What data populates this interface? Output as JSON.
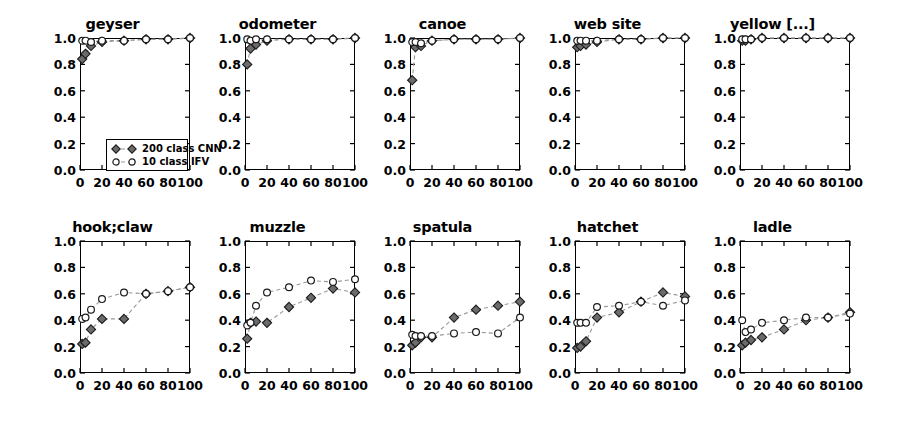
{
  "figure": {
    "background_color": "#ffffff",
    "rows": 2,
    "cols": 5,
    "marker_color": "#6b6b6b",
    "marker_edge_color": "#1a1a1a",
    "line_color": "#999999"
  },
  "legend": {
    "position": "lower-left of first panel",
    "entries": [
      {
        "label": "200 class CNN",
        "marker": "filled-diamond",
        "color": "#6b6b6b"
      },
      {
        "label": "10 class IFV",
        "marker": "open-circle",
        "color": "#ffffff"
      }
    ]
  },
  "axes": {
    "xlim": [
      0,
      100
    ],
    "ylim": [
      0.0,
      1.0
    ],
    "xticks": [
      0,
      20,
      40,
      60,
      80,
      100
    ],
    "xtick_labels": [
      "0",
      "20",
      "40",
      "60",
      "80",
      "100"
    ],
    "yticks": [
      0.0,
      0.2,
      0.4,
      0.6,
      0.8,
      1.0
    ],
    "ytick_labels": [
      "0.0",
      "0.2",
      "0.4",
      "0.6",
      "0.8",
      "1.0"
    ],
    "grid": false
  },
  "chart_data": {
    "type": "line",
    "title": "",
    "xlabel": "",
    "ylabel": "",
    "xlim": [
      0,
      100
    ],
    "ylim": [
      0.0,
      1.0
    ],
    "grid": false,
    "legend_position": "lower-left",
    "x": [
      2,
      5,
      10,
      20,
      40,
      60,
      80,
      100
    ],
    "panels": [
      {
        "title": "geyser",
        "row": 0,
        "col": 0,
        "series": [
          {
            "name": "200 class CNN",
            "marker": "filled-diamond",
            "x": [
              2,
              5,
              10,
              20,
              40,
              60,
              80,
              100
            ],
            "values": [
              0.84,
              0.88,
              0.94,
              0.97,
              0.98,
              0.99,
              0.99,
              1.0
            ]
          },
          {
            "name": "10 class IFV",
            "marker": "open-circle",
            "x": [
              2,
              5,
              10,
              20,
              40,
              60,
              80,
              100
            ],
            "values": [
              0.98,
              0.98,
              0.97,
              0.98,
              0.98,
              0.99,
              0.99,
              1.0
            ]
          }
        ]
      },
      {
        "title": "odometer",
        "row": 0,
        "col": 1,
        "series": [
          {
            "name": "200 class CNN",
            "marker": "filled-diamond",
            "x": [
              2,
              5,
              10,
              20,
              40,
              60,
              80,
              100
            ],
            "values": [
              0.8,
              0.92,
              0.95,
              0.98,
              0.99,
              0.99,
              0.99,
              1.0
            ]
          },
          {
            "name": "10 class IFV",
            "marker": "open-circle",
            "x": [
              2,
              5,
              10,
              20,
              40,
              60,
              80,
              100
            ],
            "values": [
              0.99,
              0.98,
              0.99,
              0.99,
              0.99,
              0.99,
              0.99,
              1.0
            ]
          }
        ]
      },
      {
        "title": "canoe",
        "row": 0,
        "col": 2,
        "series": [
          {
            "name": "200 class CNN",
            "marker": "filled-diamond",
            "x": [
              2,
              5,
              10,
              20,
              40,
              60,
              80,
              100
            ],
            "values": [
              0.68,
              0.93,
              0.94,
              0.98,
              0.99,
              0.99,
              0.99,
              1.0
            ]
          },
          {
            "name": "10 class IFV",
            "marker": "open-circle",
            "x": [
              2,
              5,
              10,
              20,
              40,
              60,
              80,
              100
            ],
            "values": [
              0.97,
              0.97,
              0.96,
              0.98,
              0.99,
              0.99,
              0.99,
              1.0
            ]
          }
        ]
      },
      {
        "title": "web site",
        "row": 0,
        "col": 3,
        "series": [
          {
            "name": "200 class CNN",
            "marker": "filled-diamond",
            "x": [
              2,
              5,
              10,
              20,
              40,
              60,
              80,
              100
            ],
            "values": [
              0.93,
              0.94,
              0.95,
              0.97,
              0.99,
              0.99,
              1.0,
              1.0
            ]
          },
          {
            "name": "10 class IFV",
            "marker": "open-circle",
            "x": [
              2,
              5,
              10,
              20,
              40,
              60,
              80,
              100
            ],
            "values": [
              0.98,
              0.98,
              0.98,
              0.98,
              0.99,
              0.99,
              1.0,
              1.0
            ]
          }
        ]
      },
      {
        "title": "yellow [...]",
        "row": 0,
        "col": 4,
        "series": [
          {
            "name": "200 class CNN",
            "marker": "filled-diamond",
            "x": [
              2,
              5,
              10,
              20,
              40,
              60,
              80,
              100
            ],
            "values": [
              0.98,
              0.98,
              0.99,
              1.0,
              1.0,
              1.0,
              1.0,
              1.0
            ]
          },
          {
            "name": "10 class IFV",
            "marker": "open-circle",
            "x": [
              2,
              5,
              10,
              20,
              40,
              60,
              80,
              100
            ],
            "values": [
              0.99,
              0.99,
              0.99,
              1.0,
              1.0,
              1.0,
              1.0,
              1.0
            ]
          }
        ]
      },
      {
        "title": "hook;claw",
        "row": 1,
        "col": 0,
        "series": [
          {
            "name": "200 class CNN",
            "marker": "filled-diamond",
            "x": [
              2,
              5,
              10,
              20,
              40,
              60,
              80,
              100
            ],
            "values": [
              0.22,
              0.23,
              0.33,
              0.41,
              0.41,
              0.6,
              0.62,
              0.65
            ]
          },
          {
            "name": "10 class IFV",
            "marker": "open-circle",
            "x": [
              2,
              5,
              10,
              20,
              40,
              60,
              80,
              100
            ],
            "values": [
              0.41,
              0.42,
              0.48,
              0.56,
              0.61,
              0.6,
              0.62,
              0.65
            ]
          }
        ]
      },
      {
        "title": "muzzle",
        "row": 1,
        "col": 1,
        "series": [
          {
            "name": "200 class CNN",
            "marker": "filled-diamond",
            "x": [
              2,
              5,
              10,
              20,
              40,
              60,
              80,
              100
            ],
            "values": [
              0.26,
              0.38,
              0.39,
              0.38,
              0.5,
              0.57,
              0.64,
              0.61
            ]
          },
          {
            "name": "10 class IFV",
            "marker": "open-circle",
            "x": [
              2,
              5,
              10,
              20,
              40,
              60,
              80,
              100
            ],
            "values": [
              0.36,
              0.38,
              0.51,
              0.61,
              0.65,
              0.7,
              0.69,
              0.71
            ]
          }
        ]
      },
      {
        "title": "spatula",
        "row": 1,
        "col": 2,
        "series": [
          {
            "name": "200 class CNN",
            "marker": "filled-diamond",
            "x": [
              2,
              5,
              10,
              20,
              40,
              60,
              80,
              100
            ],
            "values": [
              0.21,
              0.23,
              0.27,
              0.27,
              0.42,
              0.48,
              0.51,
              0.54
            ]
          },
          {
            "name": "10 class IFV",
            "marker": "open-circle",
            "x": [
              2,
              5,
              10,
              20,
              40,
              60,
              80,
              100
            ],
            "values": [
              0.29,
              0.28,
              0.28,
              0.28,
              0.3,
              0.31,
              0.3,
              0.42
            ]
          }
        ]
      },
      {
        "title": "hatchet",
        "row": 1,
        "col": 3,
        "series": [
          {
            "name": "200 class CNN",
            "marker": "filled-diamond",
            "x": [
              2,
              5,
              10,
              20,
              40,
              60,
              80,
              100
            ],
            "values": [
              0.19,
              0.2,
              0.24,
              0.42,
              0.46,
              0.54,
              0.61,
              0.58
            ]
          },
          {
            "name": "10 class IFV",
            "marker": "open-circle",
            "x": [
              2,
              5,
              10,
              20,
              40,
              60,
              80,
              100
            ],
            "values": [
              0.38,
              0.38,
              0.38,
              0.5,
              0.51,
              0.54,
              0.51,
              0.55
            ]
          }
        ]
      },
      {
        "title": "ladle",
        "row": 1,
        "col": 4,
        "series": [
          {
            "name": "200 class CNN",
            "marker": "filled-diamond",
            "x": [
              2,
              5,
              10,
              20,
              40,
              60,
              80,
              100
            ],
            "values": [
              0.21,
              0.23,
              0.25,
              0.27,
              0.33,
              0.4,
              0.42,
              0.46
            ]
          },
          {
            "name": "10 class IFV",
            "marker": "open-circle",
            "x": [
              2,
              5,
              10,
              20,
              40,
              60,
              80,
              100
            ],
            "values": [
              0.4,
              0.31,
              0.33,
              0.38,
              0.4,
              0.42,
              0.42,
              0.45
            ]
          }
        ]
      }
    ]
  }
}
